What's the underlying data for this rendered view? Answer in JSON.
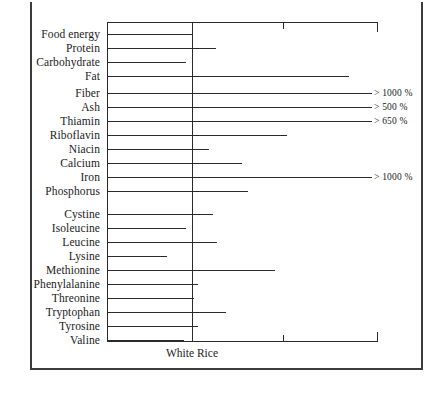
{
  "figure": {
    "reference_caption": "White Rice"
  },
  "chart_data": {
    "type": "bar",
    "orientation": "horizontal",
    "title": "",
    "subtitle": "",
    "xlabel": "",
    "ylabel": "",
    "reference_label": "White Rice",
    "reference_value": 100,
    "reference_note": "Vertical line marks the White Rice baseline (100%); bars extending to the right exceed it.",
    "xlim": [
      0,
      310
    ],
    "grid": false,
    "legend": null,
    "axis_ticks_x": [
      100,
      200,
      300
    ],
    "categories": [
      "Food energy",
      "Protein",
      "Carbohydrate",
      "Fat",
      "Fiber",
      "Ash",
      "Thiamin",
      "Riboflavin",
      "Niacin",
      "Calcium",
      "Iron",
      "Phosphorus",
      "Cystine",
      "Isoleucine",
      "Leucine",
      "Lysine",
      "Methionine",
      "Phenylalanine",
      "Threonine",
      "Tryptophan",
      "Tyrosine",
      "Valine"
    ],
    "values": [
      100,
      125,
      93,
      285,
      1000,
      500,
      650,
      211,
      118,
      159,
      1000,
      166,
      123,
      93,
      128,
      71,
      197,
      106,
      101,
      140,
      106,
      91
    ],
    "annotations": [
      {
        "category": "Fiber",
        "text": "> 1000 %"
      },
      {
        "category": "Ash",
        "text": "> 500 %"
      },
      {
        "category": "Thiamin",
        "text": "> 650 %"
      },
      {
        "category": "Iron",
        "text": "> 1000 %"
      }
    ],
    "groups": [
      {
        "name": "Nutrients",
        "categories": [
          "Food energy",
          "Protein",
          "Carbohydrate",
          "Fat",
          "Fiber",
          "Ash",
          "Thiamin",
          "Riboflavin",
          "Niacin",
          "Calcium",
          "Iron",
          "Phosphorus"
        ]
      },
      {
        "name": "Amino acids",
        "categories": [
          "Cystine",
          "Isoleucine",
          "Leucine",
          "Lysine",
          "Methionine",
          "Phenylalanine",
          "Threonine",
          "Tryptophan",
          "Tyrosine",
          "Valine"
        ]
      }
    ]
  },
  "rows": [
    {
      "label": "Food energy",
      "top": 28,
      "bar_end": 193,
      "note": null
    },
    {
      "label": "Protein",
      "top": 42,
      "bar_end": 216,
      "note": null
    },
    {
      "label": "Carbohydrate",
      "top": 56,
      "bar_end": 186,
      "note": null
    },
    {
      "label": "Fat",
      "top": 70,
      "bar_end": 349,
      "note": null
    },
    {
      "label": "Fiber",
      "top": 87,
      "bar_end": 372,
      "note": "> 1000 %"
    },
    {
      "label": "Ash",
      "top": 101,
      "bar_end": 372,
      "note": "> 500 %"
    },
    {
      "label": "Thiamin",
      "top": 115,
      "bar_end": 372,
      "note": "> 650 %"
    },
    {
      "label": "Riboflavin",
      "top": 129,
      "bar_end": 287,
      "note": null
    },
    {
      "label": "Niacin",
      "top": 143,
      "bar_end": 209,
      "note": null
    },
    {
      "label": "Calcium",
      "top": 157,
      "bar_end": 242,
      "note": null
    },
    {
      "label": "Iron",
      "top": 171,
      "bar_end": 372,
      "note": "> 1000 %"
    },
    {
      "label": "Phosphorus",
      "top": 185,
      "bar_end": 248,
      "note": null
    },
    {
      "label": "Cystine",
      "top": 208,
      "bar_end": 213,
      "note": null
    },
    {
      "label": "Isoleucine",
      "top": 222,
      "bar_end": 186,
      "note": null
    },
    {
      "label": "Leucine",
      "top": 236,
      "bar_end": 217,
      "note": null
    },
    {
      "label": "Lysine",
      "top": 250,
      "bar_end": 167,
      "note": null
    },
    {
      "label": "Methionine",
      "top": 264,
      "bar_end": 275,
      "note": null
    },
    {
      "label": "Phenylalanine",
      "top": 278,
      "bar_end": 198,
      "note": null
    },
    {
      "label": "Threonine",
      "top": 292,
      "bar_end": 194,
      "note": null
    },
    {
      "label": "Tryptophan",
      "top": 306,
      "bar_end": 226,
      "note": null
    },
    {
      "label": "Tyrosine",
      "top": 320,
      "bar_end": 198,
      "note": null
    },
    {
      "label": "Valine",
      "top": 334,
      "bar_end": 184,
      "note": null
    }
  ],
  "ticks": [
    {
      "x": 192
    },
    {
      "x": 283
    },
    {
      "x": 377
    }
  ]
}
